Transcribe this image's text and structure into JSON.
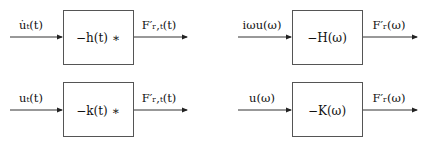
{
  "diagrams": [
    {
      "id": "time-velocity",
      "input_label": "u̇ₜ(t)",
      "block_label": "−h(t) ∗",
      "output_label": "F′ᵣ,ₜ(t)"
    },
    {
      "id": "freq-velocity",
      "input_label": "iωu(ω)",
      "block_label": "−H(ω)",
      "output_label": "F′ᵣ(ω)"
    },
    {
      "id": "time-displacement",
      "input_label": "uₜ(t)",
      "block_label": "−k(t) ∗",
      "output_label": "F′ᵣ,ₜ(t)"
    },
    {
      "id": "freq-displacement",
      "input_label": "u(ω)",
      "block_label": "−K(ω)",
      "output_label": "F′ᵣ(ω)"
    }
  ],
  "colors": {
    "line": "#333333",
    "box_border": "#555555",
    "text": "#111111",
    "background": "#ffffff"
  }
}
